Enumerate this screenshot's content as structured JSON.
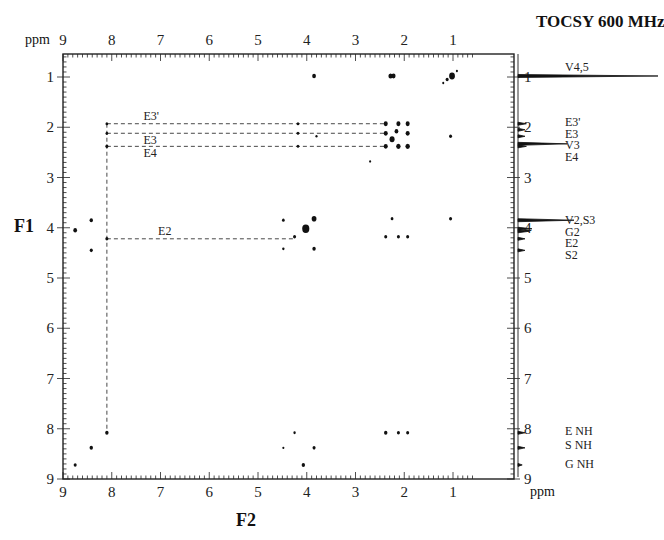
{
  "title": "TOCSY 600 MHz",
  "axis": {
    "f1_label": "F1",
    "f2_label": "F2",
    "unit": "ppm"
  },
  "chart_data": {
    "type": "scatter",
    "title": "TOCSY 600 MHz",
    "xlabel": "F2 (ppm)",
    "ylabel": "F1 (ppm)",
    "xlim": [
      9.0,
      0.55
    ],
    "ylim": [
      0.55,
      9.0
    ],
    "x_ticks": [
      9,
      8,
      7,
      6,
      5,
      4,
      3,
      2,
      1
    ],
    "y_ticks": [
      1,
      2,
      3,
      4,
      5,
      6,
      7,
      8,
      9
    ],
    "grid": false,
    "cross_peaks": [
      {
        "x": 3.85,
        "y": 0.98,
        "size": 2.2
      },
      {
        "x": 2.28,
        "y": 0.98,
        "size": 2.6
      },
      {
        "x": 2.22,
        "y": 0.98,
        "size": 2.4
      },
      {
        "x": 1.02,
        "y": 0.98,
        "size": 3.4
      },
      {
        "x": 1.12,
        "y": 1.05,
        "size": 1.8
      },
      {
        "x": 1.2,
        "y": 1.12,
        "size": 1.2
      },
      {
        "x": 0.92,
        "y": 0.88,
        "size": 1.2
      },
      {
        "x": 8.1,
        "y": 1.93,
        "size": 1.6
      },
      {
        "x": 4.18,
        "y": 1.93,
        "size": 1.5
      },
      {
        "x": 2.38,
        "y": 1.93,
        "size": 2.4
      },
      {
        "x": 2.12,
        "y": 1.93,
        "size": 2.4
      },
      {
        "x": 1.93,
        "y": 1.93,
        "size": 2.4
      },
      {
        "x": 8.1,
        "y": 2.12,
        "size": 1.6
      },
      {
        "x": 4.18,
        "y": 2.12,
        "size": 1.5
      },
      {
        "x": 3.8,
        "y": 2.18,
        "size": 1.3
      },
      {
        "x": 2.38,
        "y": 2.12,
        "size": 2.4
      },
      {
        "x": 2.16,
        "y": 2.08,
        "size": 2.2
      },
      {
        "x": 1.93,
        "y": 2.12,
        "size": 2.4
      },
      {
        "x": 2.25,
        "y": 2.24,
        "size": 3.0
      },
      {
        "x": 1.05,
        "y": 2.18,
        "size": 1.8
      },
      {
        "x": 8.1,
        "y": 2.38,
        "size": 1.8
      },
      {
        "x": 4.18,
        "y": 2.38,
        "size": 1.5
      },
      {
        "x": 2.38,
        "y": 2.38,
        "size": 2.4
      },
      {
        "x": 2.12,
        "y": 2.38,
        "size": 2.6
      },
      {
        "x": 1.93,
        "y": 2.38,
        "size": 2.6
      },
      {
        "x": 2.7,
        "y": 2.68,
        "size": 1.2
      },
      {
        "x": 8.75,
        "y": 4.05,
        "size": 2.2
      },
      {
        "x": 8.42,
        "y": 3.85,
        "size": 2.0
      },
      {
        "x": 8.42,
        "y": 4.45,
        "size": 1.8
      },
      {
        "x": 8.1,
        "y": 4.22,
        "size": 1.8
      },
      {
        "x": 4.48,
        "y": 3.85,
        "size": 1.6
      },
      {
        "x": 4.48,
        "y": 4.42,
        "size": 1.4
      },
      {
        "x": 4.25,
        "y": 4.18,
        "size": 1.8
      },
      {
        "x": 4.02,
        "y": 4.02,
        "size": 4.2
      },
      {
        "x": 3.85,
        "y": 3.82,
        "size": 2.8
      },
      {
        "x": 3.85,
        "y": 4.42,
        "size": 2.0
      },
      {
        "x": 2.25,
        "y": 3.82,
        "size": 1.6
      },
      {
        "x": 2.38,
        "y": 4.18,
        "size": 1.8
      },
      {
        "x": 2.12,
        "y": 4.18,
        "size": 1.8
      },
      {
        "x": 1.93,
        "y": 4.18,
        "size": 1.8
      },
      {
        "x": 1.05,
        "y": 3.82,
        "size": 1.8
      },
      {
        "x": 8.1,
        "y": 8.08,
        "size": 2.0
      },
      {
        "x": 8.42,
        "y": 8.38,
        "size": 2.0
      },
      {
        "x": 8.75,
        "y": 8.72,
        "size": 1.8
      },
      {
        "x": 4.48,
        "y": 8.38,
        "size": 1.2
      },
      {
        "x": 4.25,
        "y": 8.08,
        "size": 1.4
      },
      {
        "x": 4.07,
        "y": 8.72,
        "size": 2.0
      },
      {
        "x": 3.85,
        "y": 8.38,
        "size": 1.8
      },
      {
        "x": 2.38,
        "y": 8.08,
        "size": 2.0
      },
      {
        "x": 2.12,
        "y": 8.08,
        "size": 1.8
      },
      {
        "x": 1.93,
        "y": 8.08,
        "size": 1.8
      }
    ],
    "connectivity_lines": [
      {
        "label": "E3'",
        "y": 1.93,
        "x_from": 8.1,
        "x_to": 2.38,
        "label_x": 7.35,
        "label_pos": "above"
      },
      {
        "label": "E3",
        "y": 2.12,
        "x_from": 8.1,
        "x_to": 2.38,
        "label_x": 7.35,
        "label_pos": "below"
      },
      {
        "label": "E4",
        "y": 2.38,
        "x_from": 8.1,
        "x_to": 2.38,
        "label_x": 7.35,
        "label_pos": "below"
      },
      {
        "label": "E2",
        "y": 4.22,
        "x_from": 8.1,
        "x_to": 4.25,
        "label_x": 7.05,
        "label_pos": "above"
      }
    ],
    "vertical_connectivity": {
      "x": 8.1,
      "y_from": 1.93,
      "y_to": 8.08
    },
    "projection_1d": {
      "peaks": [
        {
          "ppm": 0.98,
          "height": 1.0
        },
        {
          "ppm": 1.93,
          "height": 0.06
        },
        {
          "ppm": 2.05,
          "height": 0.05
        },
        {
          "ppm": 2.18,
          "height": 0.05
        },
        {
          "ppm": 2.33,
          "height": 0.35
        },
        {
          "ppm": 2.38,
          "height": 0.06
        },
        {
          "ppm": 3.85,
          "height": 0.4
        },
        {
          "ppm": 4.02,
          "height": 0.1
        },
        {
          "ppm": 4.07,
          "height": 0.08
        },
        {
          "ppm": 4.22,
          "height": 0.05
        },
        {
          "ppm": 4.45,
          "height": 0.05
        },
        {
          "ppm": 8.08,
          "height": 0.05
        },
        {
          "ppm": 8.38,
          "height": 0.05
        },
        {
          "ppm": 8.72,
          "height": 0.03
        }
      ],
      "labels": [
        {
          "text": "V4,5",
          "ppm": 0.8
        },
        {
          "text": "E3'",
          "ppm": 1.9
        },
        {
          "text": "E3",
          "ppm": 2.13
        },
        {
          "text": "V3",
          "ppm": 2.36
        },
        {
          "text": "E4",
          "ppm": 2.59
        },
        {
          "text": "V2,S3",
          "ppm": 3.85
        },
        {
          "text": "G2",
          "ppm": 4.08
        },
        {
          "text": "E2",
          "ppm": 4.31
        },
        {
          "text": "S2",
          "ppm": 4.54
        },
        {
          "text": "E NH",
          "ppm": 8.05
        },
        {
          "text": "S NH",
          "ppm": 8.32
        },
        {
          "text": "G NH",
          "ppm": 8.7
        }
      ]
    }
  }
}
